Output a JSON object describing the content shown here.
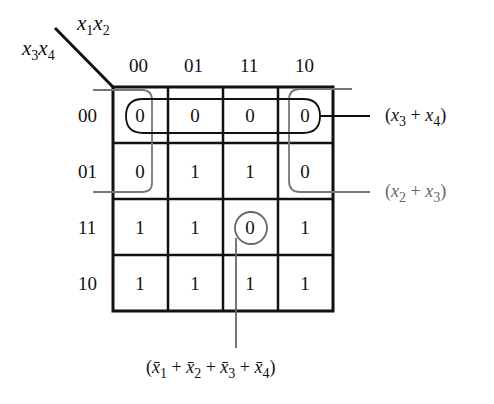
{
  "kmap": {
    "corner": {
      "col_vars": {
        "base1": "x",
        "sub1": "1",
        "base2": "x",
        "sub2": "2"
      },
      "row_vars": {
        "base1": "x",
        "sub1": "3",
        "base2": "x",
        "sub2": "4"
      }
    },
    "col_labels": [
      "00",
      "01",
      "11",
      "10"
    ],
    "row_labels": [
      "00",
      "01",
      "11",
      "10"
    ],
    "cells": [
      [
        "0",
        "0",
        "0",
        "0"
      ],
      [
        "0",
        "1",
        "1",
        "0"
      ],
      [
        "1",
        "1",
        "0",
        "1"
      ],
      [
        "1",
        "1",
        "1",
        "1"
      ]
    ],
    "groups": [
      {
        "name": "x3-plus-x4",
        "label": "(x₃ + x₄)",
        "color": "#111111",
        "cells": "row 00, all columns"
      },
      {
        "name": "x2-plus-x3",
        "label": "(x₂ + x₃)",
        "color": "#666666",
        "cells": "rows 00-01, columns 00 and 10 (wrap)"
      },
      {
        "name": "not-x1-plus-not-x2-plus-not-x3-plus-not-x4",
        "label": "(x̄₁ + x̄₂ + x̄₃ + x̄₄)",
        "color": "#666666",
        "cells": "row 11, column 11"
      }
    ]
  },
  "expressions": {
    "x3x4": {
      "open": "(",
      "v1": "x",
      "s1": "3",
      "plus": " + ",
      "v2": "x",
      "s2": "4",
      "close": ")"
    },
    "x2x3": {
      "open": "(",
      "v1": "x",
      "s1": "2",
      "plus": " + ",
      "v2": "x",
      "s2": "3",
      "close": ")"
    },
    "bottom": {
      "open": "(",
      "v1": "x̄",
      "s1": "1",
      "v2": "x̄",
      "s2": "2",
      "v3": "x̄",
      "s3": "3",
      "v4": "x̄",
      "s4": "4",
      "plus": " + ",
      "close": ")"
    }
  },
  "colors": {
    "ink": "#111111",
    "gray": "#666666"
  }
}
